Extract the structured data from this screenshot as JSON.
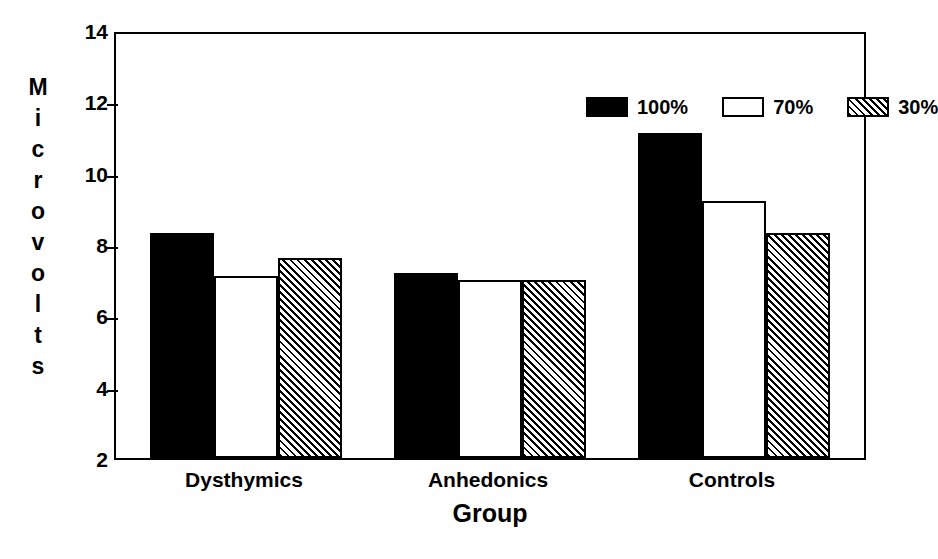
{
  "chart_data": {
    "type": "bar",
    "title": "",
    "xlabel": "Group",
    "ylabel": "Microvolts",
    "categories": [
      "Dysthymics",
      "Anhedonics",
      "Controls"
    ],
    "series": [
      {
        "name": "100%",
        "fill": "solid",
        "values": [
          8.3,
          7.2,
          11.1
        ]
      },
      {
        "name": "70%",
        "fill": "open",
        "values": [
          7.1,
          7.0,
          9.2
        ]
      },
      {
        "name": "30%",
        "fill": "hatch",
        "values": [
          7.6,
          7.0,
          8.3
        ]
      }
    ],
    "ylim": [
      2,
      14
    ],
    "yticks": [
      2,
      4,
      6,
      8,
      10,
      12,
      14
    ],
    "ytick_labels": [
      "2",
      "4",
      "6",
      "8",
      "10",
      "12",
      "14"
    ],
    "grid": false,
    "legend_position": "top-right",
    "bar_color_solid": "#000000",
    "bar_color_open": "#ffffff",
    "bar_color_hatch": "#000000",
    "axis_color": "#000000",
    "background": "#ffffff"
  },
  "ylabel_letters": [
    "M",
    "i",
    "c",
    "r",
    "o",
    "v",
    "o",
    "l",
    "t",
    "s"
  ],
  "legend": {
    "items": [
      {
        "label": "100%",
        "fill": "solid"
      },
      {
        "label": "70%",
        "fill": "open"
      },
      {
        "label": "30%",
        "fill": "hatch"
      }
    ]
  }
}
